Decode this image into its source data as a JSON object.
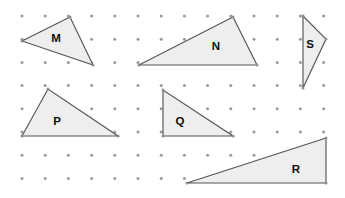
{
  "figure": {
    "type": "dot-grid-triangles-worksheet",
    "width": 345,
    "height": 198,
    "background_color": "#ffffff",
    "grid": {
      "dot_color": "#9a9a9a",
      "dot_radius": 1.5,
      "x_start": 22,
      "y_start": 16,
      "x_spacing": 23.2,
      "y_spacing": 23.2,
      "columns": 14,
      "rows": 8
    },
    "style": {
      "fill_color": "#eeeeee",
      "stroke_color": "#555555",
      "stroke_width": 1.15,
      "label_color": "#0f0f0f"
    },
    "shapes": [
      {
        "label": "M",
        "name": "triangle-m",
        "points": "22,41 70,17 93,65",
        "vertices": [
          [
            22,
            41
          ],
          [
            70,
            17
          ],
          [
            93,
            65
          ]
        ],
        "label_x": 56,
        "label_y": 39
      },
      {
        "label": "N",
        "name": "triangle-n",
        "points": "139,65 233,17 257,65",
        "vertices": [
          [
            139,
            65
          ],
          [
            233,
            17
          ],
          [
            257,
            65
          ]
        ],
        "label_x": 216,
        "label_y": 47
      },
      {
        "label": "S",
        "name": "triangle-s",
        "points": "303,16 326,39 303,88",
        "vertices": [
          [
            303,
            16
          ],
          [
            326,
            39
          ],
          [
            303,
            88
          ]
        ],
        "label_x": 310,
        "label_y": 45
      },
      {
        "label": "P",
        "name": "triangle-p",
        "points": "22,136 48,89 118,136",
        "vertices": [
          [
            22,
            136
          ],
          [
            48,
            89
          ],
          [
            118,
            136
          ]
        ],
        "label_x": 57,
        "label_y": 122
      },
      {
        "label": "Q",
        "name": "triangle-q",
        "points": "163,90 163,136 233,136",
        "vertices": [
          [
            163,
            90
          ],
          [
            163,
            136
          ],
          [
            233,
            136
          ]
        ],
        "label_x": 180,
        "label_y": 122
      },
      {
        "label": "R",
        "name": "triangle-r",
        "points": "187,183 326,138 326,183",
        "vertices": [
          [
            187,
            183
          ],
          [
            326,
            138
          ],
          [
            326,
            183
          ]
        ],
        "label_x": 296,
        "label_y": 170
      }
    ]
  }
}
